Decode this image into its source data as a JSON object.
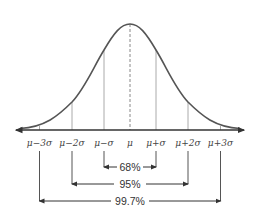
{
  "diagram": {
    "colors": {
      "curve": "#555555",
      "axis": "#333333",
      "gridline": "#aaaaaa",
      "text": "#444444"
    },
    "axis_labels": [
      "μ−3σ",
      "μ−2σ",
      "μ−σ",
      "μ",
      "μ+σ",
      "μ+2σ",
      "μ+3σ"
    ],
    "ranges": [
      {
        "label": "68%",
        "from": "μ−σ",
        "to": "μ+σ"
      },
      {
        "label": "95%",
        "from": "μ−2σ",
        "to": "μ+2σ"
      },
      {
        "label": "99.7%",
        "from": "μ−3σ",
        "to": "μ+3σ"
      }
    ]
  }
}
